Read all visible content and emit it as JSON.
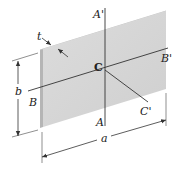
{
  "figure": {
    "plate": {
      "face_color": "#d9d9d9",
      "edge_color": "#b8b8b8",
      "top_edge_color": "#efefef"
    },
    "axes": [
      {
        "id": "A",
        "start_label": "A",
        "end_label": "A'"
      },
      {
        "id": "B",
        "start_label": "B",
        "end_label": "B'"
      },
      {
        "id": "C",
        "start_label": "C",
        "end_label": "C'"
      }
    ],
    "centroid_label": "C",
    "dimensions": {
      "width": "a",
      "height": "b",
      "thickness": "t"
    },
    "line_color": "#333333"
  }
}
